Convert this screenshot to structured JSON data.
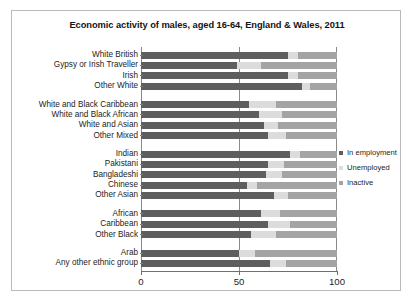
{
  "chart_data": {
    "type": "bar",
    "orientation": "horizontal",
    "stacked": true,
    "title": "Economic activity of males, aged 16-64, England & Wales, 2011",
    "xlabel": "",
    "ylabel": "",
    "xlim": [
      0,
      100
    ],
    "xticks": [
      "0",
      "50",
      "100"
    ],
    "xtick_values": [
      0,
      50,
      100
    ],
    "grid": "vertical gridline at 50",
    "legend_position": "right",
    "colors": {
      "in_employment": "#5e5e5e",
      "unemployed": "#dcdcdc",
      "inactive": "#a4a4a4",
      "plot_border": "#8a8a8a",
      "frame_border": "#b9b9b9",
      "background": "#ffffff",
      "text": "#1d1d1d"
    },
    "legend": [
      {
        "label": "In employment",
        "color": "#5e5e5e",
        "swatch": "legend-swatch-in-employment"
      },
      {
        "label": "Unemployed",
        "color": "#dcdcdc",
        "swatch": "legend-swatch-unemployed"
      },
      {
        "label": "Inactive",
        "color": "#a4a4a4",
        "swatch": "legend-swatch-inactive"
      }
    ],
    "series": [
      {
        "name": "In employment",
        "color": "#5e5e5e",
        "values": [
          75,
          49,
          75,
          82,
          55,
          60,
          63,
          65,
          76,
          65,
          64,
          54,
          68,
          61,
          65,
          56,
          50,
          66
        ]
      },
      {
        "name": "Unemployed",
        "color": "#dcdcdc",
        "values": [
          5,
          12,
          5,
          4,
          14,
          12,
          7,
          9,
          5,
          8,
          8,
          5,
          7,
          10,
          11,
          13,
          8,
          8
        ]
      },
      {
        "name": "Inactive",
        "color": "#a4a4a4",
        "values": [
          20,
          39,
          20,
          14,
          31,
          28,
          30,
          26,
          19,
          27,
          28,
          41,
          25,
          29,
          24,
          31,
          42,
          26
        ]
      }
    ],
    "categories": [
      "White British",
      "Gypsy or Irish Traveller",
      "Irish",
      "Other White",
      "White and Black Caribbean",
      "White and Black African",
      "White and Asian",
      "Other Mixed",
      "Indian",
      "Pakistani",
      "Bangladeshi",
      "Chinese",
      "Other Asian",
      "African",
      "Caribbean",
      "Other Black",
      "Arab",
      "Any other ethnic group"
    ],
    "group_breaks_after": [
      3,
      7,
      12,
      15
    ]
  }
}
